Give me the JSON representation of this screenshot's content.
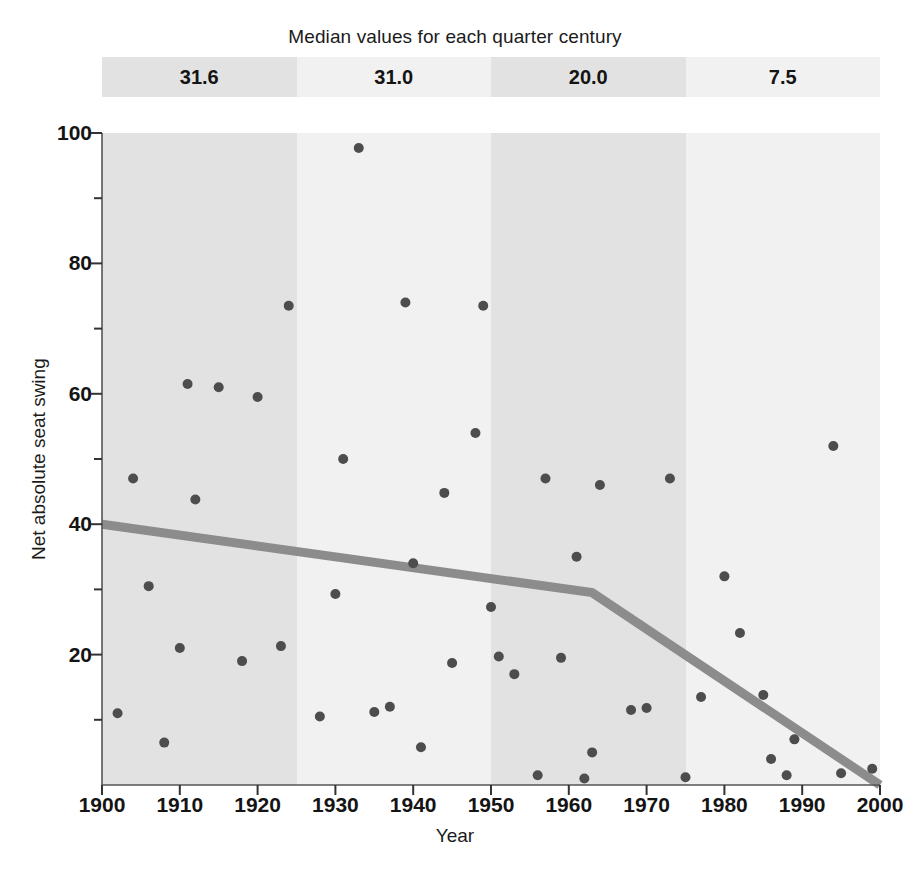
{
  "legend": {
    "title": "Median values for each quarter century",
    "cells": [
      {
        "label": "31.6",
        "period": "1900-1925",
        "color": "#e2e2e2"
      },
      {
        "label": "31.0",
        "period": "1925-1950",
        "color": "#f1f1f1"
      },
      {
        "label": "20.0",
        "period": "1950-1975",
        "color": "#e2e2e2"
      },
      {
        "label": "7.5",
        "period": "1975-2000",
        "color": "#f1f1f1"
      }
    ]
  },
  "chart_data": {
    "type": "scatter",
    "title": "",
    "xlabel": "Year",
    "ylabel": "Net absolute seat swing",
    "xlim": [
      1900,
      2000
    ],
    "ylim": [
      0,
      100
    ],
    "grid": false,
    "legend_position": "top",
    "xticks": [
      1900,
      1910,
      1920,
      1930,
      1940,
      1950,
      1960,
      1970,
      1980,
      1990,
      2000
    ],
    "xtick_labels": [
      "1900",
      "1910",
      "1920",
      "1930",
      "1940",
      "1950",
      "1960",
      "1970",
      "1980",
      "1990",
      "2000"
    ],
    "yticks": [
      20,
      40,
      60,
      80,
      100
    ],
    "ytick_labels": [
      "20",
      "40",
      "60",
      "80",
      "100"
    ],
    "yminorticks": [
      10,
      30,
      50,
      70,
      90
    ],
    "marker_color": "#4d4d4d",
    "marker_size": 9,
    "points": [
      {
        "x": 1902,
        "y": 11
      },
      {
        "x": 1904,
        "y": 47
      },
      {
        "x": 1906,
        "y": 30.5
      },
      {
        "x": 1908,
        "y": 6.5
      },
      {
        "x": 1910,
        "y": 21
      },
      {
        "x": 1911,
        "y": 61.5
      },
      {
        "x": 1912,
        "y": 43.8
      },
      {
        "x": 1915,
        "y": 61
      },
      {
        "x": 1918,
        "y": 19
      },
      {
        "x": 1920,
        "y": 59.5
      },
      {
        "x": 1923,
        "y": 21.3
      },
      {
        "x": 1924,
        "y": 73.5
      },
      {
        "x": 1928,
        "y": 10.5
      },
      {
        "x": 1930,
        "y": 29.3
      },
      {
        "x": 1931,
        "y": 50
      },
      {
        "x": 1933,
        "y": 97.7
      },
      {
        "x": 1935,
        "y": 11.2
      },
      {
        "x": 1937,
        "y": 12
      },
      {
        "x": 1939,
        "y": 74
      },
      {
        "x": 1940,
        "y": 34
      },
      {
        "x": 1941,
        "y": 5.8
      },
      {
        "x": 1944,
        "y": 44.8
      },
      {
        "x": 1945,
        "y": 18.7
      },
      {
        "x": 1948,
        "y": 54
      },
      {
        "x": 1949,
        "y": 73.5
      },
      {
        "x": 1950,
        "y": 27.3
      },
      {
        "x": 1951,
        "y": 19.7
      },
      {
        "x": 1953,
        "y": 17
      },
      {
        "x": 1956,
        "y": 1.5
      },
      {
        "x": 1957,
        "y": 47
      },
      {
        "x": 1959,
        "y": 19.5
      },
      {
        "x": 1961,
        "y": 35
      },
      {
        "x": 1962,
        "y": 1
      },
      {
        "x": 1963,
        "y": 5
      },
      {
        "x": 1964,
        "y": 46
      },
      {
        "x": 1968,
        "y": 11.5
      },
      {
        "x": 1970,
        "y": 11.8
      },
      {
        "x": 1973,
        "y": 47
      },
      {
        "x": 1975,
        "y": 1.2
      },
      {
        "x": 1977,
        "y": 13.5
      },
      {
        "x": 1980,
        "y": 32
      },
      {
        "x": 1982,
        "y": 23.3
      },
      {
        "x": 1985,
        "y": 13.8
      },
      {
        "x": 1986,
        "y": 4
      },
      {
        "x": 1988,
        "y": 1.5
      },
      {
        "x": 1989,
        "y": 7
      },
      {
        "x": 1994,
        "y": 52
      },
      {
        "x": 1995,
        "y": 1.8
      },
      {
        "x": 1999,
        "y": 2.5
      }
    ],
    "trend_line": {
      "color": "#8c8c8c",
      "width": 9,
      "vertices": [
        {
          "x": 1900,
          "y": 40
        },
        {
          "x": 1963,
          "y": 29.5
        },
        {
          "x": 2000,
          "y": 0
        }
      ]
    }
  }
}
